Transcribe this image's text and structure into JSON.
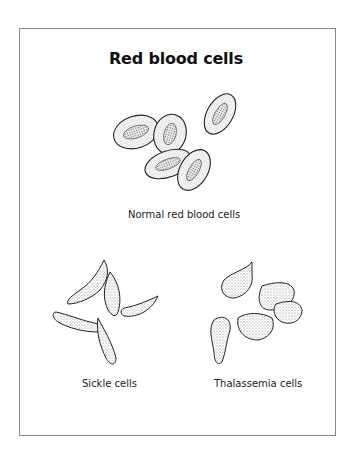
{
  "title": "Red blood cells",
  "groups": [
    {
      "label": "Normal red blood cells",
      "shape": "biconcave-disc",
      "count": 5
    },
    {
      "label": "Sickle cells",
      "shape": "sickle",
      "count": 5
    },
    {
      "label": "Thalassemia cells",
      "shape": "irregular",
      "count": 5
    }
  ],
  "colors": {
    "ink": "#222222",
    "stipple": "#9a9a9a",
    "frame": "#8a8a8a"
  }
}
